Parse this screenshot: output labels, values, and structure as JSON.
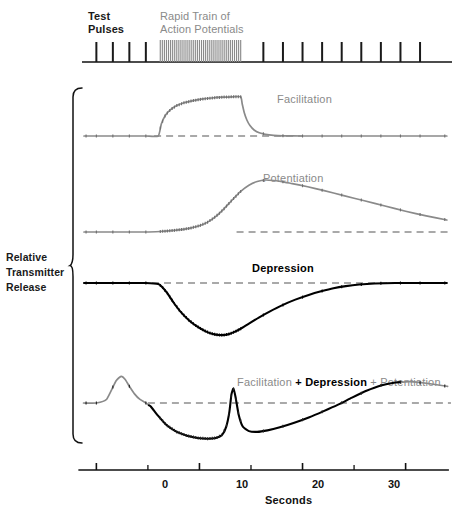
{
  "figure": {
    "title_stimulus_left": "Test\nPulses",
    "title_stimulus_right": "Rapid Train of\nAction Potentials",
    "y_axis_label": "Relative\nTransmitter\nRelease",
    "x_axis_title": "Seconds",
    "x_tick_labels": [
      "0",
      "10",
      "20",
      "30"
    ],
    "x_tick_values": [
      0,
      10,
      20,
      30
    ],
    "x_minor_tick_values": [
      5,
      15,
      25
    ],
    "panel_labels": {
      "facilitation": "Facilitation",
      "potentiation": "Potentiation",
      "depression": "Depression",
      "combined_part1": "Facilitation",
      "combined_part2": " + Depression",
      "combined_part3": " + Potentiation"
    },
    "colors": {
      "gray_curve": "#8a8a8a",
      "black_curve": "#000000",
      "baseline_dash": "#555555",
      "axis": "#111111",
      "stimulus_train": "#8a8a8a",
      "test_pulse": "#1a1a1a"
    }
  },
  "chart_data": {
    "type": "line",
    "xlabel": "Seconds",
    "ylabel": "Relative Transmitter Release",
    "xlim": [
      -1.2,
      34.5
    ],
    "grid": false,
    "legend": "inline-annotations",
    "stimulus": {
      "test_pulse_times": [
        0.0,
        1.6,
        3.2,
        4.8,
        16.2,
        18.1,
        20.0,
        21.9,
        23.8,
        25.7,
        27.6,
        29.5,
        31.4
      ],
      "train_start": 6.2,
      "train_end": 14.0,
      "train_pulse_count": 40,
      "train_label": "Rapid Train of Action Potentials",
      "test_label": "Test Pulses"
    },
    "panels": [
      {
        "name": "facilitation",
        "label": "Facilitation",
        "color": "#8a8a8a",
        "baseline": 0,
        "x": [
          -1.2,
          0,
          1.6,
          3.2,
          4.8,
          6.0,
          6.3,
          6.7,
          7.2,
          7.8,
          8.5,
          9.3,
          10.2,
          11.2,
          12.2,
          13.2,
          14.0,
          14.15,
          14.35,
          14.6,
          14.9,
          15.3,
          15.8,
          16.4,
          17.2,
          18.1,
          20.0,
          22.0,
          25.0,
          28.0,
          31.0,
          34.0
        ],
        "y": [
          0,
          0,
          0,
          0,
          0,
          0,
          0.3,
          0.52,
          0.66,
          0.76,
          0.83,
          0.88,
          0.92,
          0.95,
          0.97,
          0.98,
          0.98,
          0.8,
          0.58,
          0.4,
          0.26,
          0.15,
          0.08,
          0.04,
          0.015,
          0.005,
          0,
          0,
          0,
          0,
          0,
          0
        ]
      },
      {
        "name": "potentiation",
        "label": "Potentiation",
        "color": "#8a8a8a",
        "baseline": 0,
        "x": [
          -1.2,
          0,
          1.6,
          3.2,
          4.8,
          6.2,
          7.0,
          8.0,
          9.0,
          10.0,
          10.8,
          11.6,
          12.4,
          13.2,
          14.0,
          14.8,
          15.6,
          16.4,
          17.2,
          18.0,
          19.0,
          20.5,
          22.0,
          24.0,
          26.0,
          28.0,
          30.0,
          32.0,
          34.0
        ],
        "y": [
          0,
          0,
          0,
          0,
          0,
          0.01,
          0.02,
          0.04,
          0.07,
          0.12,
          0.19,
          0.3,
          0.45,
          0.62,
          0.78,
          0.9,
          0.97,
          1.0,
          0.99,
          0.97,
          0.93,
          0.87,
          0.8,
          0.7,
          0.6,
          0.5,
          0.4,
          0.31,
          0.23
        ]
      },
      {
        "name": "depression",
        "label": "Depression",
        "color": "#000000",
        "baseline": 0,
        "x": [
          -1.2,
          0,
          1.6,
          3.2,
          4.8,
          6.0,
          6.4,
          6.9,
          7.5,
          8.2,
          9.0,
          9.8,
          10.6,
          11.3,
          11.9,
          12.4,
          12.9,
          13.4,
          14.0,
          14.8,
          15.8,
          16.8,
          18.0,
          19.3,
          20.6,
          21.8,
          23.0,
          24.2,
          25.5,
          27.0,
          29.0,
          31.0,
          34.0
        ],
        "y": [
          0,
          0,
          0,
          0,
          0,
          -0.02,
          -0.08,
          -0.2,
          -0.38,
          -0.56,
          -0.72,
          -0.84,
          -0.93,
          -0.98,
          -1.0,
          -1.0,
          -0.98,
          -0.94,
          -0.88,
          -0.78,
          -0.66,
          -0.55,
          -0.43,
          -0.32,
          -0.23,
          -0.16,
          -0.1,
          -0.06,
          -0.03,
          -0.01,
          0,
          0,
          0
        ]
      },
      {
        "name": "combined",
        "label": "Facilitation + Depression + Potentiation",
        "color": "mixed",
        "baseline": 0,
        "x": [
          -1.2,
          0,
          1.0,
          1.9,
          2.4,
          2.8,
          3.2,
          3.7,
          4.2,
          4.7,
          5.3,
          6.0,
          6.8,
          7.8,
          8.8,
          9.8,
          10.8,
          11.6,
          12.2,
          12.6,
          12.9,
          13.1,
          13.3,
          13.5,
          13.8,
          14.2,
          14.8,
          15.6,
          16.6,
          17.8,
          19.2,
          20.6,
          22.0,
          23.4,
          24.8,
          26.2,
          27.6,
          29.0,
          30.4,
          32.0,
          34.0
        ],
        "y": [
          0,
          0,
          0.1,
          0.58,
          0.7,
          0.62,
          0.44,
          0.24,
          0.1,
          0.02,
          -0.1,
          -0.34,
          -0.58,
          -0.76,
          -0.86,
          -0.92,
          -0.94,
          -0.92,
          -0.84,
          -0.62,
          -0.24,
          0.22,
          0.38,
          0.16,
          -0.3,
          -0.62,
          -0.74,
          -0.76,
          -0.72,
          -0.64,
          -0.52,
          -0.38,
          -0.22,
          -0.05,
          0.14,
          0.32,
          0.46,
          0.54,
          0.56,
          0.52,
          0.44
        ],
        "segments": [
          {
            "from_x": -1.2,
            "to_x": 5.1,
            "color": "#8a8a8a",
            "note": "facilitation-dominant rising spike"
          },
          {
            "from_x": 5.1,
            "to_x": 29.6,
            "color": "#000000",
            "note": "depression-dominant trough and rebound"
          },
          {
            "from_x": 29.6,
            "to_x": 34.0,
            "color": "#8a8a8a",
            "note": "potentiation-dominant tail"
          }
        ]
      }
    ]
  }
}
